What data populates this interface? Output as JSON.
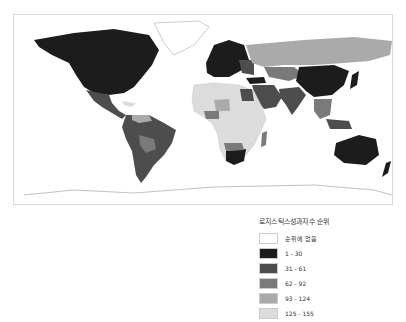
{
  "map": {
    "title": "로지스틱스성과지수 순위",
    "type": "choropleth world map",
    "legend": [
      {
        "label": "순위에 없음",
        "color": "#ffffff"
      },
      {
        "label": "1 - 30",
        "color": "#1c1c1c"
      },
      {
        "label": "31 - 61",
        "color": "#4d4d4d"
      },
      {
        "label": "62 - 92",
        "color": "#7a7a7a"
      },
      {
        "label": "93 - 124",
        "color": "#aaaaaa"
      },
      {
        "label": "125 - 155",
        "color": "#dcdcdc"
      }
    ]
  }
}
